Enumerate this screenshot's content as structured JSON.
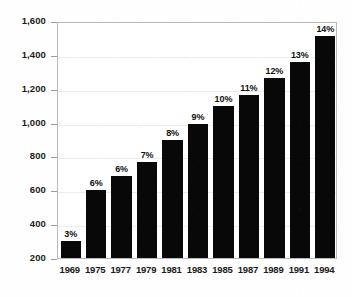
{
  "chart_data": {
    "type": "bar",
    "title": "",
    "subtitle": "",
    "xlabel": "",
    "ylabel": "",
    "categories": [
      "1969",
      "1975",
      "1977",
      "1979",
      "1981",
      "1983",
      "1985",
      "1987",
      "1989",
      "1991",
      "1994"
    ],
    "values": [
      300,
      600,
      685,
      770,
      900,
      990,
      1100,
      1165,
      1265,
      1355,
      1510
    ],
    "data_labels": [
      "3%",
      "6%",
      "6%",
      "7%",
      "8%",
      "9%",
      "10%",
      "11%",
      "12%",
      "13%",
      "14%"
    ],
    "ylim": [
      200,
      1600
    ],
    "ytick_labels": [
      "1,600",
      "1,400",
      "1,200",
      "1,000",
      "800",
      "600",
      "400",
      "200"
    ],
    "ytick_values": [
      1600,
      1400,
      1200,
      1000,
      800,
      600,
      400,
      200
    ],
    "grid": true,
    "legend": "none",
    "bar_color": "#080808",
    "axis_color": "#b9b9b9",
    "text_color": "#1b1b1b"
  }
}
